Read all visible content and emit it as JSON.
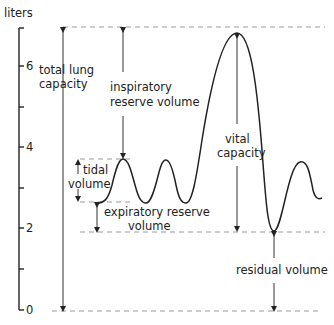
{
  "diagram": {
    "type": "spirogram",
    "axis": {
      "unit_label": "liters",
      "ticks": [
        {
          "value": 0,
          "label": "0"
        },
        {
          "value": 1,
          "label": ""
        },
        {
          "value": 2,
          "label": "2"
        },
        {
          "value": 3,
          "label": ""
        },
        {
          "value": 4,
          "label": "4"
        },
        {
          "value": 5,
          "label": ""
        },
        {
          "value": 6,
          "label": "6"
        }
      ]
    },
    "labels": {
      "total_lung_capacity": [
        "total lung",
        "capacity"
      ],
      "inspiratory_reserve_volume": [
        "inspiratory",
        "reserve volume"
      ],
      "tidal_volume": [
        "tidal",
        "volume"
      ],
      "expiratory_reserve_volume": [
        "expiratory reserve",
        "volume"
      ],
      "vital_capacity": [
        "vital",
        "capacity"
      ],
      "residual_volume": [
        "residual volume"
      ]
    },
    "colors": {
      "line": "#222222",
      "dashed": "#999999",
      "text": "#222222"
    }
  }
}
